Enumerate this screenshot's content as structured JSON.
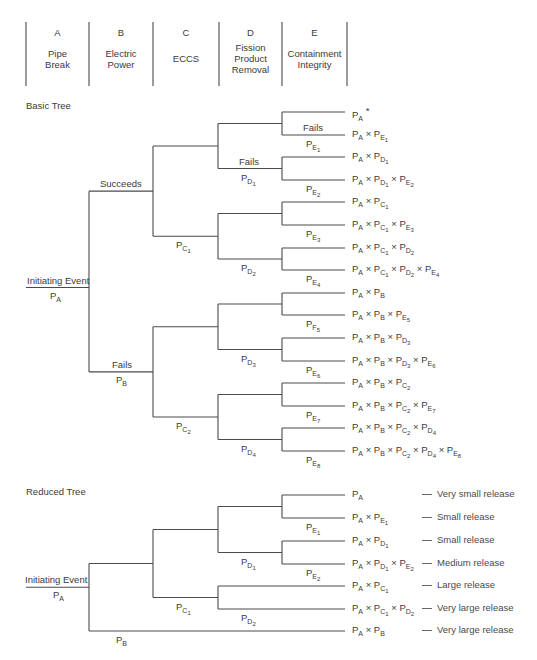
{
  "header": {
    "columns": [
      {
        "letter": "A",
        "name": "Pipe Break",
        "lines": [
          "Pipe",
          "Break"
        ]
      },
      {
        "letter": "B",
        "name": "Electric Power",
        "lines": [
          "Electric",
          "Power"
        ]
      },
      {
        "letter": "C",
        "name": "ECCS",
        "lines": [
          "ECCS"
        ]
      },
      {
        "letter": "D",
        "name": "Fission Product Removal",
        "lines": [
          "Fission",
          "Product",
          "Removal"
        ]
      },
      {
        "letter": "E",
        "name": "Containment Integrity",
        "lines": [
          "Containment",
          "Integrity"
        ]
      }
    ]
  },
  "basic_tree": {
    "title": "Basic Tree",
    "initiating_event_label": "Initiating Event",
    "initiating_event_prob": {
      "p": "P",
      "sub": "A"
    },
    "branch_labels": {
      "succeeds": "Succeeds",
      "fails_b": "Fails",
      "fails_d": "Fails",
      "fails_e": "Fails"
    },
    "branch_probs": {
      "PB": {
        "p": "P",
        "sub": "B"
      },
      "PC1": {
        "p": "P",
        "sub": "C",
        "subsub": "1"
      },
      "PC2": {
        "p": "P",
        "sub": "C",
        "subsub": "2"
      },
      "PD1": {
        "p": "P",
        "sub": "D",
        "subsub": "1"
      },
      "PD2": {
        "p": "P",
        "sub": "D",
        "subsub": "2"
      },
      "PD3": {
        "p": "P",
        "sub": "D",
        "subsub": "3"
      },
      "PD4": {
        "p": "P",
        "sub": "D",
        "subsub": "4"
      },
      "PE1": {
        "p": "P",
        "sub": "E",
        "subsub": "1"
      },
      "PE2": {
        "p": "P",
        "sub": "E",
        "subsub": "2"
      },
      "PE3": {
        "p": "P",
        "sub": "E",
        "subsub": "3"
      },
      "PE4": {
        "p": "P",
        "sub": "E",
        "subsub": "4"
      },
      "PE5": {
        "p": "P",
        "sub": "F",
        "subsub": "5"
      },
      "PE6": {
        "p": "P",
        "sub": "E",
        "subsub": "6"
      },
      "PE7": {
        "p": "P",
        "sub": "E",
        "subsub": "7"
      },
      "PE8": {
        "p": "P",
        "sub": "E",
        "subsub": "8"
      }
    },
    "outcomes": [
      "P_A *",
      "P_A × P_E1",
      "P_A × P_D1",
      "P_A × P_D1 × P_E2",
      "P_A × P_C1",
      "P_A × P_C1 × P_E3",
      "P_A × P_C1 × P_D2",
      "P_A × P_C1 × P_D2 × P_E4",
      "P_A × P_B",
      "P_A × P_B × P_E5",
      "P_A × P_B × P_D3",
      "P_A × P_B × P_D3 × P_E6",
      "P_A × P_B × P_C2",
      "P_A × P_B × P_C2 × P_E7",
      "P_A × P_B × P_C2 × P_D4",
      "P_A × P_B × P_C2 × P_D4 × P_E8"
    ]
  },
  "reduced_tree": {
    "title": "Reduced Tree",
    "initiating_event_label": "Initiating Event",
    "initiating_event_prob": {
      "p": "P",
      "sub": "A"
    },
    "outcomes": [
      {
        "expr": "P_A",
        "release": "Very small release"
      },
      {
        "expr": "P_A × P_E1",
        "release": "Small release"
      },
      {
        "expr": "P_A × P_D1",
        "release": "Small release"
      },
      {
        "expr": "P_A × P_D1 × P_E2",
        "release": "Medium release"
      },
      {
        "expr": "P_A × P_C1",
        "release": "Large release"
      },
      {
        "expr": "P_A × P_C1 × P_D2",
        "release": "Very large release"
      },
      {
        "expr": "P_A × P_B",
        "release": "Very large release"
      }
    ]
  }
}
